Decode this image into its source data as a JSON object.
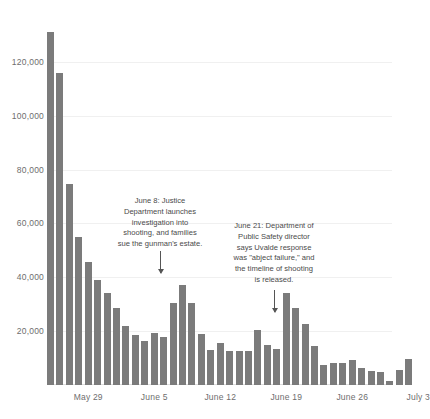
{
  "chart_data": {
    "type": "bar",
    "title": "",
    "subtitle": "",
    "xlabel": "",
    "ylabel": "",
    "ylim": [
      0,
      140000
    ],
    "grid": true,
    "legend": "none",
    "bar_color": "#7b7b7b",
    "y_ticks": [
      "20,000",
      "40,000",
      "60,000",
      "80,000",
      "100,000",
      "120,000"
    ],
    "y_tick_values": [
      20000,
      40000,
      60000,
      80000,
      100000,
      120000
    ],
    "x_ticks": [
      "May 29",
      "June 5",
      "June 12",
      "June 19",
      "June 26",
      "July 3"
    ],
    "x_tick_indices": [
      4,
      11,
      18,
      25,
      32,
      39
    ],
    "values": [
      131000,
      116000,
      74500,
      55000,
      45500,
      39000,
      34000,
      28500,
      22000,
      18500,
      16500,
      19500,
      18000,
      30500,
      37000,
      30500,
      19000,
      13000,
      15500,
      12500,
      12800,
      12500,
      20500,
      15000,
      13200,
      34000,
      28500,
      22500,
      14500,
      7500,
      8000,
      8200,
      9200,
      6200,
      5200,
      4800,
      1500,
      5500,
      9600
    ],
    "annotations": [
      {
        "id": "june-8",
        "text": "June 8: Justice\nDepartment launches\ninvestigation into\nshooting, and families\nsue the gunman's estate."
      },
      {
        "id": "june-21",
        "text": "June 21: Department of\nPublic Safety director\nsays Uvalde response\nwas \"abject failure,\" and\nthe timeline of shooting\nis released."
      }
    ]
  }
}
